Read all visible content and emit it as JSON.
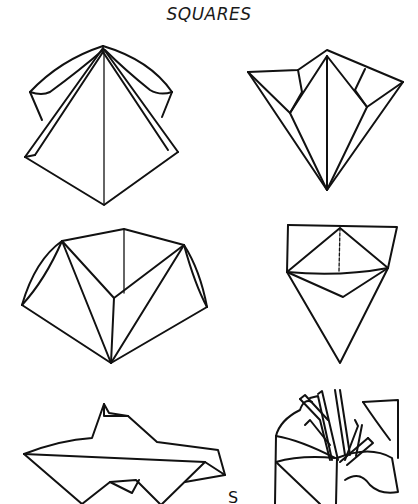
{
  "page": {
    "title": "SQUARES",
    "partial_label": "S"
  },
  "figures": [
    {
      "id": 1,
      "position": "top-left",
      "description": "folded square, pyramid with side flaps"
    },
    {
      "id": 2,
      "position": "top-right",
      "description": "inverted kite with folded corners"
    },
    {
      "id": 3,
      "position": "middle-left",
      "description": "open pentagon-shaped fold"
    },
    {
      "id": 4,
      "position": "middle-right",
      "description": "triangle with folded top band"
    },
    {
      "id": 5,
      "position": "bottom-left",
      "description": "flat boat-like fold"
    },
    {
      "id": 6,
      "position": "bottom-right",
      "description": "flower with stamens"
    }
  ]
}
